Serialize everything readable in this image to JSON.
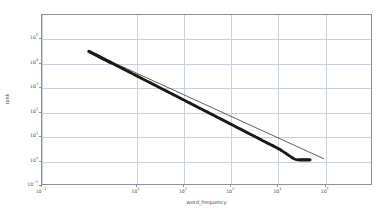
{
  "chart_data": {
    "type": "scatter",
    "title": "",
    "xlabel": "word_frequency",
    "ylabel": "rank",
    "xscale": "log",
    "yscale": "log",
    "xlim": [
      0.1,
      1000000
    ],
    "ylim": [
      0.1,
      1000000
    ],
    "grid": true,
    "legend": null,
    "xticks": [
      {
        "value": 0.1,
        "label": "10−1",
        "exp": "−1"
      },
      {
        "value": 10,
        "label": "10¹",
        "exp": "1"
      },
      {
        "value": 100,
        "label": "10²",
        "exp": "2"
      },
      {
        "value": 1000,
        "label": "10³",
        "exp": "3"
      },
      {
        "value": 10000,
        "label": "10⁴",
        "exp": "4"
      },
      {
        "value": 100000,
        "label": "10⁵",
        "exp": "5"
      }
    ],
    "yticks": [
      {
        "value": 0.1,
        "label": "10−1",
        "exp": "−1"
      },
      {
        "value": 1,
        "label": "10⁰",
        "exp": "0"
      },
      {
        "value": 10,
        "label": "10¹",
        "exp": "1"
      },
      {
        "value": 100,
        "label": "10²",
        "exp": "2"
      },
      {
        "value": 1000,
        "label": "10³",
        "exp": "3"
      },
      {
        "value": 10000,
        "label": "10⁴",
        "exp": "4"
      },
      {
        "value": 100000,
        "label": "10⁵",
        "exp": "5"
      }
    ],
    "series": [
      {
        "name": "rank vs word_frequency",
        "kind": "scatter",
        "color": "#1a1a1a",
        "marker": "o",
        "marker_size": 2.0,
        "points": [
          [
            1.0,
            31000
          ],
          [
            2.0,
            15500
          ],
          [
            3.0,
            10300
          ],
          [
            4.0,
            7800
          ],
          [
            5.0,
            6200
          ],
          [
            6.0,
            5200
          ],
          [
            7.0,
            4450
          ],
          [
            8.0,
            3900
          ],
          [
            9.0,
            3450
          ],
          [
            10.0,
            3100
          ],
          [
            12.0,
            2600
          ],
          [
            14.0,
            2220
          ],
          [
            17.0,
            1830
          ],
          [
            20.0,
            1560
          ],
          [
            24.0,
            1300
          ],
          [
            29.0,
            1080
          ],
          [
            35.0,
            890
          ],
          [
            42.0,
            740
          ],
          [
            50.0,
            625
          ],
          [
            60.0,
            520
          ],
          [
            72.0,
            435
          ],
          [
            87.0,
            360
          ],
          [
            105.0,
            298
          ],
          [
            126.0,
            248
          ],
          [
            152.0,
            206
          ],
          [
            183.0,
            171
          ],
          [
            220.0,
            142
          ],
          [
            265.0,
            118
          ],
          [
            319.0,
            98
          ],
          [
            384.0,
            81
          ],
          [
            462.0,
            68
          ],
          [
            556.0,
            56
          ],
          [
            669.0,
            47
          ],
          [
            805.0,
            39
          ],
          [
            969.0,
            32
          ],
          [
            1166.0,
            27
          ],
          [
            1403.0,
            22
          ],
          [
            1688.0,
            18.5
          ],
          [
            2031.0,
            15.3
          ],
          [
            2444.0,
            12.7
          ],
          [
            2941.0,
            10.6
          ],
          [
            3539.0,
            8.8
          ],
          [
            4259.0,
            7.3
          ],
          [
            5124.0,
            6.0
          ],
          [
            6166.0,
            5.0
          ],
          [
            7419.0,
            4.2
          ],
          [
            8927.0,
            3.5
          ],
          [
            10000.0,
            3.1
          ],
          [
            11500.0,
            2.7
          ],
          [
            13000.0,
            2.3
          ],
          [
            14500.0,
            2.0
          ],
          [
            16000.0,
            1.75
          ],
          [
            18000.0,
            1.5
          ],
          [
            20000.0,
            1.3
          ],
          [
            23000.0,
            1.1
          ],
          [
            26000.0,
            1.0
          ],
          [
            30000.0,
            1.0
          ],
          [
            50000.0,
            1.0
          ]
        ],
        "description": "Rank-frequency (Zipf) scatter; dense overlapping markers form a continuous band from upper-left to lower-right, with discrete separated markers at both extremes and a flattening tail at high frequency."
      },
      {
        "name": "power-law fit",
        "kind": "line",
        "color": "#333333",
        "linewidth": 0.8,
        "points": [
          [
            1.0,
            31000
          ],
          [
            100000.0,
            1.1
          ]
        ],
        "description": "Straight reference line on log-log axes passing through the bulk of the data and extending past the deviating tail."
      }
    ],
    "annotations": []
  }
}
